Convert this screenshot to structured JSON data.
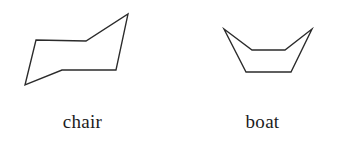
{
  "figure": {
    "background_color": "#ffffff",
    "stroke_color": "#2b2b2b",
    "label_color": "#1c1c1c",
    "width": 349,
    "height": 150
  },
  "diagram_data": {
    "type": "line-drawing",
    "subject": "cyclohexane ring conformations",
    "shapes": [
      {
        "id": "chair",
        "label": "chair",
        "vertex_count": 6,
        "closed": true,
        "points": "25,85 36,40 86,41 128,14 116,70 62,70",
        "points_list": [
          [
            25,
            85
          ],
          [
            36,
            40
          ],
          [
            86,
            41
          ],
          [
            128,
            14
          ],
          [
            116,
            70
          ],
          [
            62,
            70
          ]
        ]
      },
      {
        "id": "boat",
        "label": "boat",
        "vertex_count": 6,
        "closed": true,
        "points": "224,29 252,50 285,50 312,29 291,72 246,72",
        "points_list": [
          [
            224,
            29
          ],
          [
            252,
            50
          ],
          [
            285,
            50
          ],
          [
            312,
            29
          ],
          [
            291,
            72
          ],
          [
            246,
            72
          ]
        ]
      }
    ]
  },
  "labels": {
    "chair": "chair",
    "boat": "boat"
  }
}
